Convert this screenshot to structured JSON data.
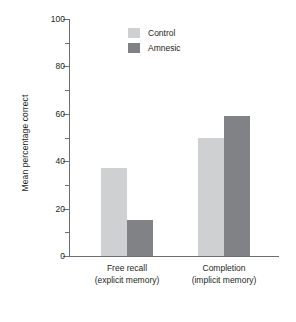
{
  "chart_data": {
    "type": "bar",
    "title": "",
    "subtitle": "",
    "xlabel": "",
    "ylabel": "Mean percentage correct",
    "ylim": [
      0,
      100
    ],
    "y_major_ticks": [
      0,
      20,
      40,
      60,
      80,
      100
    ],
    "y_minor_ticks": [
      10,
      30,
      50,
      70,
      90
    ],
    "y_tick_labels": [
      "0",
      "20",
      "40",
      "60",
      "80",
      "100"
    ],
    "grid": false,
    "legend_position": "top-center",
    "categories": [
      "Free recall\n(explicit memory)",
      "Completion\n(implicit memory)"
    ],
    "category_labels": [
      {
        "line1": "Free recall",
        "line2": "(explicit memory)"
      },
      {
        "line1": "Completion",
        "line2": "(implicit memory)"
      }
    ],
    "series": [
      {
        "name": "Control",
        "color": "#cfd0d1",
        "values": [
          37,
          50
        ]
      },
      {
        "name": "Amnesic",
        "color": "#808285",
        "values": [
          15,
          59
        ]
      }
    ]
  },
  "legend": {
    "items": [
      {
        "label": "Control",
        "color": "#cfd0d1"
      },
      {
        "label": "Amnesic",
        "color": "#808285"
      }
    ]
  },
  "axis": {
    "y_title": "Mean percentage correct",
    "axis_color": "#6d6e71"
  }
}
